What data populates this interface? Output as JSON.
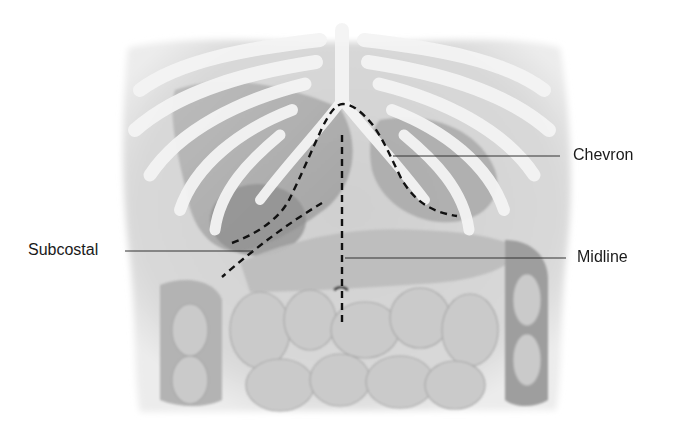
{
  "figure": {
    "labels": {
      "chevron": "Chevron",
      "midline": "Midline",
      "subcostal": "Subcostal"
    },
    "incisions": [
      {
        "name": "Chevron",
        "style": "dashed curve",
        "label_side": "right"
      },
      {
        "name": "Midline",
        "style": "dashed vertical line",
        "label_side": "right"
      },
      {
        "name": "Subcostal",
        "style": "dashed oblique line",
        "label_side": "left"
      }
    ],
    "colors": {
      "background": "#ffffff",
      "torso": "#d8d8d8",
      "ribs": "#f2f2f2",
      "organs": "#a9a9a9",
      "bowel": "#c4c4c4",
      "incision_line": "#111111",
      "leader_line": "#333333",
      "label_text": "#1a1a1a"
    }
  }
}
